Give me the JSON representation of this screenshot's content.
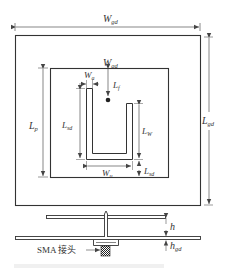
{
  "diagram": {
    "type": "antenna-geometry",
    "top_view": {
      "outer_ground": {
        "label_width": "W",
        "label_width_sub": "gd",
        "label_height": "L",
        "label_height_sub": "gd"
      },
      "patch": {
        "label_width": "W",
        "label_width_sub": "gd",
        "label_height": "L",
        "label_height_sub": "p"
      },
      "u_slot": {
        "arm_width": {
          "main": "W",
          "sub": "a"
        },
        "feed_offset": {
          "main": "L",
          "sub": "f"
        },
        "left_arm_length": {
          "main": "L",
          "sub": "sd"
        },
        "right_arm_length": {
          "main": "L",
          "sub": "W"
        },
        "bottom_gap": {
          "main": "L",
          "sub": "sd"
        },
        "slot_width": {
          "main": "W",
          "sub": "u"
        }
      }
    },
    "side_view": {
      "patch_height": {
        "main": "h",
        "sub": ""
      },
      "ground_thickness": {
        "main": "h",
        "sub": "gd"
      },
      "connector_label": "SMA 接头"
    },
    "colors": {
      "line": "#333333",
      "dim_line": "#555555",
      "background": "#ffffff"
    }
  }
}
